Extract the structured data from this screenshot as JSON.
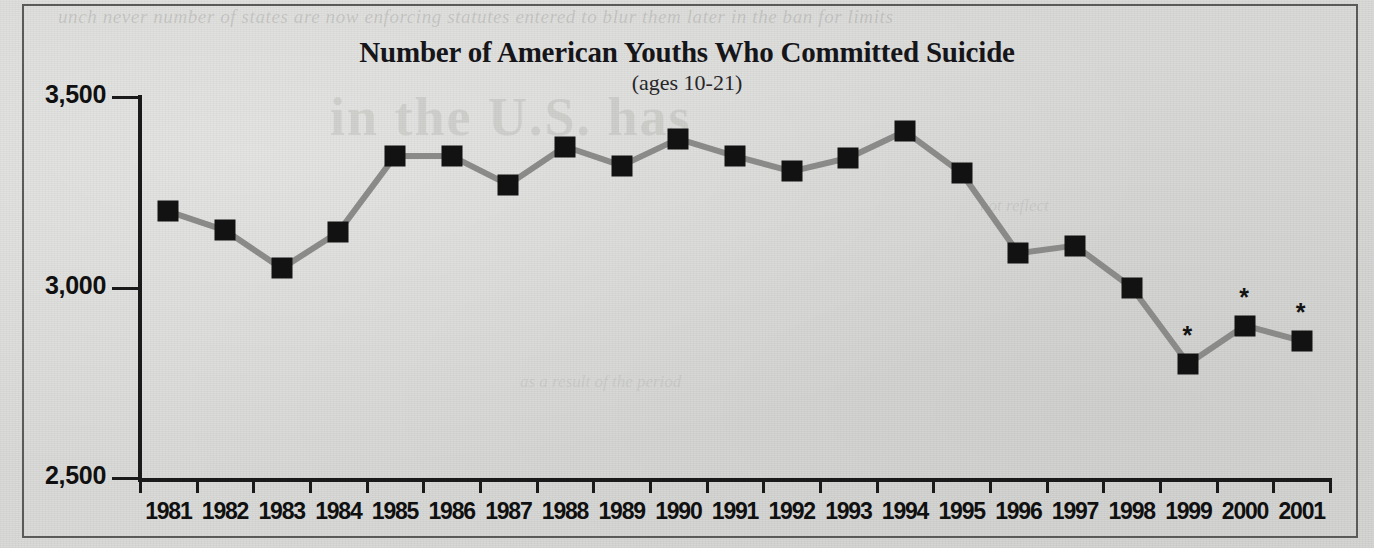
{
  "figure": {
    "title": "Number of American Youths Who Committed Suicide",
    "subtitle": "(ages 10-21)",
    "background_color": "#d8d8d6",
    "line_color": "#8a8a88",
    "marker_color": "#121212",
    "text_color": "#101010"
  },
  "ghost_text": {
    "top": "unch never number of states are now enforcing statutes entered to blur them later in the ban for limits",
    "mid": "in the U.S. has",
    "low": "not reflect",
    "low2": "as a result of the period"
  },
  "axes": {
    "y_tick_labels": [
      "3,500",
      "3,000",
      "2,500"
    ],
    "y_tick_values": [
      3500,
      3000,
      2500
    ],
    "x_tick_labels": [
      "1981",
      "1982",
      "1983",
      "1984",
      "1985",
      "1986",
      "1987",
      "1988",
      "1989",
      "1990",
      "1991",
      "1992",
      "1993",
      "1994",
      "1995",
      "1996",
      "1997",
      "1998",
      "1999",
      "2000",
      "2001"
    ]
  },
  "footnote_marker": "*",
  "chart_data": {
    "type": "line",
    "title": "Number of American Youths Who Committed Suicide",
    "subtitle": "(ages 10-21)",
    "xlabel": "",
    "ylabel": "",
    "ylim": [
      2500,
      3500
    ],
    "yticks": [
      2500,
      3000,
      3500
    ],
    "ytick_labels": [
      "2,500",
      "3,000",
      "3,500"
    ],
    "grid": false,
    "legend": false,
    "marker": "square",
    "categories": [
      "1981",
      "1982",
      "1983",
      "1984",
      "1985",
      "1986",
      "1987",
      "1988",
      "1989",
      "1990",
      "1991",
      "1992",
      "1993",
      "1994",
      "1995",
      "1996",
      "1997",
      "1998",
      "1999",
      "2000",
      "2001"
    ],
    "values": [
      3200,
      3150,
      3050,
      3145,
      3345,
      3345,
      3270,
      3370,
      3320,
      3390,
      3345,
      3305,
      3340,
      3410,
      3300,
      3090,
      3110,
      3000,
      2800,
      2900,
      2860
    ],
    "annotations": [
      {
        "category": "1999",
        "text": "*"
      },
      {
        "category": "2000",
        "text": "*"
      },
      {
        "category": "2001",
        "text": "*"
      }
    ]
  }
}
